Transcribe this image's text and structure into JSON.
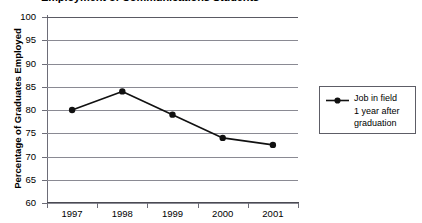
{
  "chart_data": {
    "type": "line",
    "title": "Employment of Communications Students",
    "xlabel": "",
    "ylabel": "Percentage of Graduates Employed",
    "categories": [
      "1997",
      "1998",
      "1999",
      "2000",
      "2001"
    ],
    "series": [
      {
        "name": "Job in field\n1 year after\ngraduation",
        "values": [
          80,
          84,
          79,
          74,
          72.5
        ]
      }
    ],
    "ylim": [
      60,
      100
    ],
    "ytick_labels": [
      "100",
      "95",
      "90",
      "85",
      "80",
      "75",
      "70",
      "65",
      "60"
    ],
    "ytick_values": [
      100,
      95,
      90,
      85,
      80,
      75,
      70,
      65,
      60
    ],
    "grid": true,
    "legend_position": "right",
    "legend_entries": [
      "Job in field\n1 year after\ngraduation"
    ],
    "colors": {
      "line": "#111111",
      "marker": "#111111",
      "grid": "#8a8a93",
      "axis": "#6d6d78",
      "background": "#ffffff"
    }
  },
  "legend": {
    "entry_label": "Job in field\n1 year after\ngraduation",
    "marker_name": "line-with-circle-marker"
  }
}
